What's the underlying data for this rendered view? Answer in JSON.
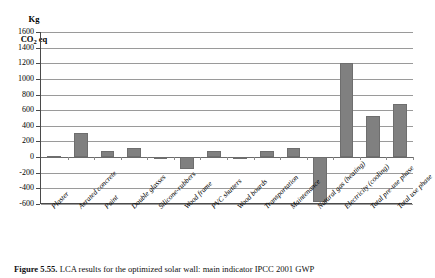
{
  "chart_data": {
    "type": "bar",
    "title": "",
    "xlabel": "",
    "ylabel": "Kg CO2 eq",
    "ylabel_line1": "Kg",
    "ylabel_line2": "CO",
    "ylabel_sub": "2",
    "ylabel_line3": " eq",
    "ylim": [
      -600,
      1600
    ],
    "ytick_values": [
      1600,
      1400,
      1200,
      1000,
      800,
      600,
      400,
      200,
      0,
      -200,
      -400,
      -600
    ],
    "ytick_labels": [
      "1600",
      "1400",
      "1200",
      "1000",
      "800",
      "600",
      "400",
      "200",
      "0",
      "-200",
      "-400",
      "-600"
    ],
    "grid": true,
    "legend": "none",
    "bar_color": "#808080",
    "categories": [
      "Plaster",
      "Aerated concrete",
      "Paint",
      "Double glasses",
      "Silicone-rubbers",
      "Wood frame",
      "PVC shutters",
      "Wood boards",
      "Transportation",
      "Maintenance",
      "Natural gas (heating)",
      "Electricity (cooling)",
      "Total pre-use phase",
      "Total use phase"
    ],
    "values": [
      20,
      310,
      75,
      120,
      0,
      -155,
      75,
      -20,
      80,
      110,
      -570,
      1200,
      520,
      680
    ]
  },
  "caption": {
    "figure_number": "Figure 5.55.",
    "text": "LCA results for the optimized solar wall: main indicator IPCC 2001 GWP"
  }
}
